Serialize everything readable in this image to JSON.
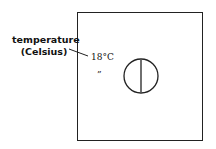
{
  "diagram": {
    "callout_label": {
      "line1": "temperature",
      "line2": "(Celsius)"
    },
    "reading": "18°C",
    "ditto_mark": "”",
    "gauge_icon": "circle-with-vertical-line"
  }
}
